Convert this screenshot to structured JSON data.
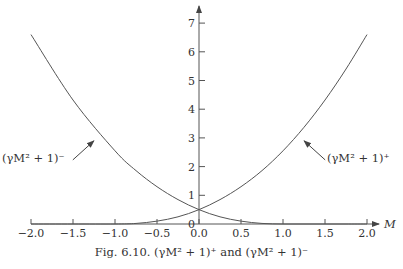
{
  "caption": "Fig. 6.10. (γM² + 1)⁺ and (γM² + 1)⁻",
  "chart_data": {
    "type": "line",
    "title": "Fig. 6.10. (γM² + 1)⁺ and (γM² + 1)⁻",
    "xlabel": "M",
    "ylabel": "",
    "xlim": [
      -2.0,
      2.0
    ],
    "ylim": [
      0,
      7.5
    ],
    "x_ticks": [
      -2.0,
      -1.5,
      -1.0,
      -0.5,
      0.0,
      0.5,
      1.0,
      1.5,
      2.0
    ],
    "x_tick_labels": [
      "−2.0",
      "−1.5",
      "−1.0",
      "−0.5",
      "0.0",
      "0.5",
      "1.0",
      "1.5",
      "2.0"
    ],
    "y_ticks": [
      0,
      1,
      2,
      3,
      4,
      5,
      6,
      7
    ],
    "y_tick_labels": [
      "0",
      "1",
      "2",
      "3",
      "4",
      "5",
      "6",
      "7"
    ],
    "grid": false,
    "legend": "none (curves labeled with arrows)",
    "x": [
      -2.0,
      -1.5,
      -1.0,
      -0.75,
      -0.5,
      -0.25,
      0.0,
      0.25,
      0.5,
      0.75,
      1.0,
      1.25,
      1.5,
      1.75,
      2.0
    ],
    "series": [
      {
        "name": "(γM² + 1)⁺",
        "values": [
          0,
          0,
          0,
          0.02,
          0.1,
          0.25,
          0.5,
          0.85,
          1.3,
          1.86,
          2.55,
          3.37,
          4.32,
          5.4,
          6.6
        ],
        "annotation": {
          "label": "(γM² + 1)⁺",
          "arrow_to_M": 1.24,
          "arrow_to_value": 3.0,
          "position": "right"
        }
      },
      {
        "name": "(γM² + 1)⁻",
        "values": [
          6.6,
          4.32,
          2.55,
          1.86,
          1.3,
          0.85,
          0.5,
          0.25,
          0.1,
          0.02,
          0,
          0,
          0,
          0,
          0
        ],
        "annotation": {
          "label": "(γM² + 1)⁻",
          "arrow_to_M": -1.24,
          "arrow_to_value": 3.0,
          "position": "left"
        }
      }
    ],
    "intersection": {
      "M": 0.0,
      "value": 0.5
    }
  },
  "labels": {
    "x_axis": "M",
    "plus_curve": "(γM² + 1)⁺",
    "minus_curve": "(γM² + 1)⁻"
  }
}
